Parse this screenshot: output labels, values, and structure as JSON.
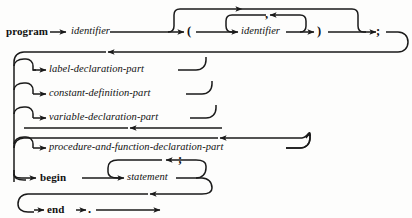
{
  "diagram": {
    "kind": "syntax-railroad-diagram",
    "subject": "program",
    "stroke_color": "#1a1a1a",
    "background_color": "#fdfdfc",
    "nodes": {
      "program_kw": "program",
      "identifier_name": "identifier",
      "paren_open": "(",
      "identifier_param": "identifier",
      "comma": ",",
      "paren_close": ")",
      "semicolon_header": ";",
      "label_declaration_part": "label-declaration-part",
      "constant_definition_part": "constant-definition-part",
      "variable_declaration_part": "variable-declaration-part",
      "procedure_and_function_declaration_part": "procedure-and-function-declaration-part",
      "begin_kw": "begin",
      "statement": "statement",
      "semicolon_statement": ";",
      "end_kw": "end",
      "period": "."
    },
    "branches": [
      {
        "id": "label-branch",
        "label": "label-declaration-part",
        "optional": true
      },
      {
        "id": "constant-branch",
        "label": "constant-definition-part",
        "optional": true
      },
      {
        "id": "variable-branch",
        "label": "variable-declaration-part",
        "optional": true
      },
      {
        "id": "procedure-branch",
        "label": "procedure-and-function-declaration-part",
        "optional": true,
        "repeatable": true
      },
      {
        "id": "begin-branch",
        "label": "begin",
        "optional": false
      }
    ],
    "loops": [
      {
        "id": "param-list-loop",
        "separator": ",",
        "body": "identifier"
      },
      {
        "id": "statement-list-loop",
        "separator": ";",
        "body": "statement"
      }
    ]
  }
}
